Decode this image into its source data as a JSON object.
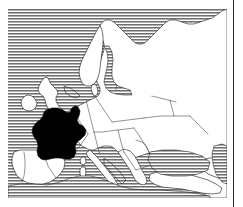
{
  "figure": {
    "kind": "thematic-locator-map",
    "caption": "",
    "width": 243,
    "height": 207,
    "rendering": "scanned black and white line art, halftone horizontal hatching for water"
  },
  "map": {
    "region": "Europe",
    "projection_note": "unlabelled regional outline map",
    "highlighted_country": "France",
    "highlight_style": "solid black fill",
    "land_style": "white fill with thin outline",
    "water_style": "horizontal line hatching",
    "graticule": "none",
    "labels": [],
    "scale_bar": "none",
    "north_arrow": "none",
    "legend": "none",
    "bounds": {
      "left": 8,
      "top": 9,
      "right": 227,
      "bottom": 198
    }
  },
  "colors": {
    "highlight": "#000000",
    "land": "#ffffff",
    "outline": "#1c1c1c",
    "water_hatch": "#707070",
    "background": "#ffffff",
    "rule": "#2a2a2a"
  },
  "decorations": {
    "right_rule": "vertical rule at right margin"
  }
}
